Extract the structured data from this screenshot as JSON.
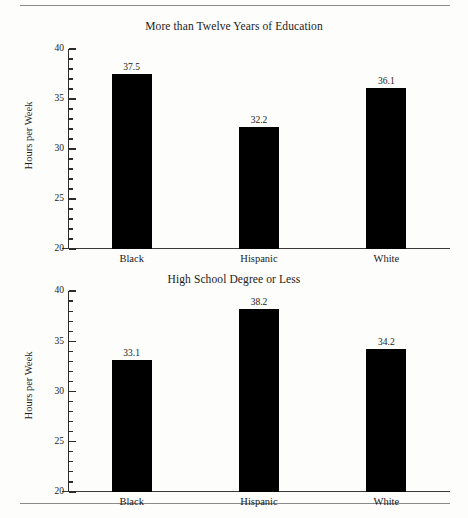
{
  "figure": {
    "background_color": "#fdfdfc",
    "bar_color": "#000000",
    "axis_color": "#2b2b2b",
    "rule_color": "#8a8a8a"
  },
  "chart_data": [
    {
      "type": "bar",
      "title": "More than Twelve Years of Education",
      "xlabel": "",
      "ylabel": "Hours per Week",
      "categories": [
        "Black",
        "Hispanic",
        "White"
      ],
      "values": [
        37.5,
        32.2,
        36.1
      ],
      "value_labels": [
        "37.5",
        "32.2",
        "36.1"
      ],
      "ylim": [
        20,
        40
      ],
      "yticks": [
        20,
        25,
        30,
        35,
        40
      ],
      "ytick_labels": [
        "20",
        "25",
        "30",
        "35",
        "40"
      ],
      "yminor_ticks": [
        21,
        22,
        23,
        24,
        26,
        27,
        28,
        29,
        31,
        32,
        33,
        34,
        36,
        37,
        38,
        39
      ],
      "grid": false,
      "legend": false
    },
    {
      "type": "bar",
      "title": "High School Degree or Less",
      "xlabel": "",
      "ylabel": "Hours per Week",
      "categories": [
        "Black",
        "Hispanic",
        "White"
      ],
      "values": [
        33.1,
        38.2,
        34.2
      ],
      "value_labels": [
        "33.1",
        "38.2",
        "34.2"
      ],
      "ylim": [
        20,
        40
      ],
      "yticks": [
        20,
        25,
        30,
        35,
        40
      ],
      "ytick_labels": [
        "20",
        "25",
        "30",
        "35",
        "40"
      ],
      "yminor_ticks": [
        21,
        22,
        23,
        24,
        26,
        27,
        28,
        29,
        31,
        32,
        33,
        34,
        36,
        37,
        38,
        39
      ],
      "grid": false,
      "legend": false
    }
  ]
}
